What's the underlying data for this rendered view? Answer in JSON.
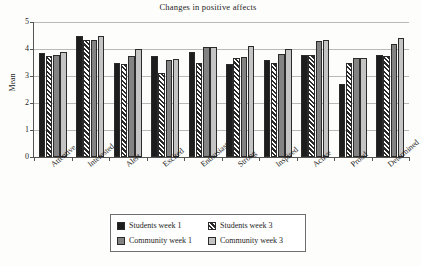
{
  "chart_data": {
    "type": "bar",
    "title": "Changes in positive affects",
    "xlabel": "",
    "ylabel": "Mean",
    "ylim": [
      0,
      5
    ],
    "yticks": [
      "0",
      "1",
      "2",
      "3",
      "4",
      "5"
    ],
    "grid": true,
    "legend_position": "bottom",
    "categories": [
      "Attentive",
      "Interested",
      "Alert",
      "Excited",
      "Enthusiastic",
      "Strong",
      "Inspired",
      "Active",
      "Proud",
      "Determined"
    ],
    "series": [
      {
        "name": "Students week 1",
        "color": "#1d1d1d",
        "pattern": "solid",
        "values": [
          3.85,
          4.47,
          3.48,
          3.75,
          3.9,
          3.43,
          3.58,
          3.76,
          2.72,
          3.76
        ]
      },
      {
        "name": "Students week 3",
        "color": "#ffffff",
        "pattern": "diagonal-hatch",
        "values": [
          3.75,
          4.34,
          3.45,
          3.12,
          3.48,
          3.67,
          3.48,
          3.77,
          3.5,
          3.73
        ]
      },
      {
        "name": "Community week 1",
        "color": "#838383",
        "pattern": "solid",
        "values": [
          3.79,
          4.34,
          3.75,
          3.6,
          4.07,
          3.7,
          3.8,
          4.28,
          3.67,
          4.18
        ]
      },
      {
        "name": "Community week 3",
        "color": "#c4c4c4",
        "pattern": "solid",
        "values": [
          3.9,
          4.47,
          3.99,
          3.62,
          4.07,
          4.12,
          4.0,
          4.33,
          3.68,
          4.41
        ]
      }
    ]
  },
  "legend": {
    "items": [
      {
        "label": "Students week 1"
      },
      {
        "label": "Students week 3"
      },
      {
        "label": "Community week 1"
      },
      {
        "label": "Community week 3"
      }
    ]
  }
}
